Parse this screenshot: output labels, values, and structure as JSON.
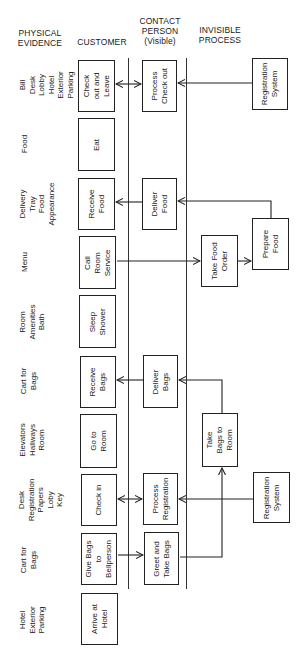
{
  "headers": {
    "physical_evidence": "PHYSICAL\nEVIDENCE",
    "customer": "CUSTOMER",
    "contact_person": "CONTACT\nPERSON\n(Visible)",
    "invisible_process": "INVISIBLE\nPROCESS"
  },
  "physical_evidence": [
    "Bill\nDesk\nLobby\nHotel\nExterior\nParking",
    "Food",
    "Delivery\nTray\nFood\nAppearance",
    "Menu",
    "Room\nAmenities\nBath",
    "Cart for\nBags",
    "Elevators\nHallways\nRoom",
    "Desk\nRegistration\nPapers\nLoby\nKey",
    "Cart for\nBags",
    "Hotel\nExterior\nParking"
  ],
  "customer": [
    "Check\nout and\nLeave",
    "Eat",
    "Receive\nFood",
    "Call\nRoom\nService",
    "Sleep\nShower",
    "Receive\nBags",
    "Go to\nRoom",
    "Check in",
    "Give Bags\nto\nBellperson",
    "Arrive at\nHotel"
  ],
  "contact_person": [
    "Process\nCheck out",
    "Deliver\nFood",
    "Deliver\nBags",
    "Process\nRegistration",
    "Greet and\nTake Bags"
  ],
  "invisible_process": [
    "Registration\nSystem",
    "Take Food\nOrder",
    "Prepare\nFood",
    "Take\nBags to\nRoom",
    "Registration\nSystem"
  ],
  "colors": {
    "line": "#222222",
    "background": "#ffffff"
  }
}
